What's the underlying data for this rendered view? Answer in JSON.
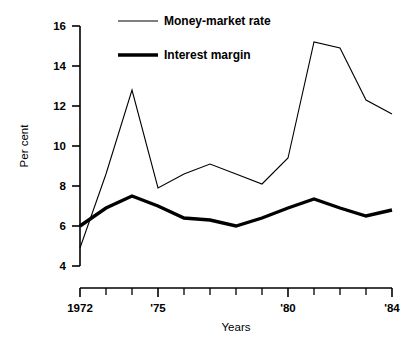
{
  "chart_data": {
    "type": "line",
    "title": "",
    "xlabel": "Years",
    "ylabel": "Per cent",
    "x": [
      1972,
      1973,
      1974,
      1975,
      1976,
      1977,
      1978,
      1979,
      1980,
      1981,
      1982,
      1983,
      1984
    ],
    "xlim": [
      1972,
      1984
    ],
    "ylim": [
      4,
      16
    ],
    "yticks": [
      4,
      6,
      8,
      10,
      12,
      14,
      16
    ],
    "ytick_labels": [
      "4",
      "6",
      "8",
      "10",
      "12",
      "14",
      "16"
    ],
    "xticks": [
      1972,
      1973,
      1974,
      1975,
      1976,
      1977,
      1978,
      1979,
      1980,
      1981,
      1982,
      1983,
      1984
    ],
    "xtick_labels": [
      "1972",
      "",
      "",
      "'75",
      "",
      "",
      "",
      "",
      "'80",
      "",
      "",
      "",
      "'84"
    ],
    "grid": false,
    "legend_position": "top-center",
    "series": [
      {
        "name": "Money-market rate",
        "style": "thin",
        "color": "#000000",
        "values": [
          4.9,
          8.6,
          12.8,
          7.9,
          8.6,
          9.1,
          8.6,
          8.1,
          9.4,
          15.2,
          14.9,
          12.3,
          11.6
        ]
      },
      {
        "name": "Interest margin",
        "style": "thick",
        "color": "#000000",
        "values": [
          6.0,
          6.9,
          7.5,
          7.0,
          6.4,
          6.3,
          6.0,
          6.4,
          6.9,
          7.35,
          6.9,
          6.5,
          6.8
        ]
      }
    ]
  },
  "legend": {
    "items": [
      {
        "label": "Money-market rate",
        "swatch": "thin-line-swatch"
      },
      {
        "label": "Interest margin",
        "swatch": "thick-line-swatch"
      }
    ]
  },
  "axes": {
    "y_title": "Per cent",
    "x_title": "Years"
  }
}
